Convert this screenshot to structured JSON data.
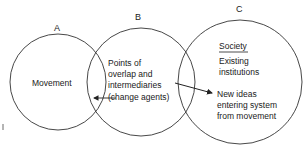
{
  "diagram": {
    "circles": [
      {
        "id": "A",
        "label": "A",
        "text": [
          "Movement"
        ]
      },
      {
        "id": "B",
        "label": "B",
        "text": [
          "Points of",
          "overlap and",
          "intermediaries",
          "(change agents)"
        ]
      },
      {
        "id": "C",
        "label": "C",
        "title": "Society",
        "text": [
          "Existing",
          "institutions"
        ],
        "subtext": [
          "New ideas",
          "entering system",
          "from movement"
        ]
      }
    ],
    "arrows": [
      {
        "from": "B",
        "to": "A",
        "description": "change agents to movement"
      },
      {
        "from": "B",
        "to": "C",
        "description": "intermediaries to new ideas"
      }
    ],
    "stroke_color": "#333333"
  }
}
